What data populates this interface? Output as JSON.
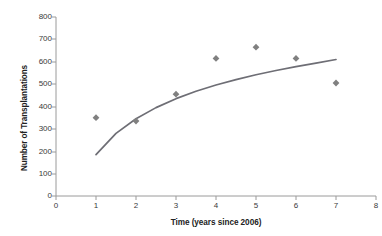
{
  "chart_data": {
    "type": "scatter",
    "title": "",
    "xlabel": "Time (years since 2006)",
    "ylabel": "Number of Transplantations",
    "xlim": [
      0,
      8
    ],
    "ylim": [
      0,
      800
    ],
    "x_ticks": [
      "0",
      "1",
      "2",
      "3",
      "4",
      "5",
      "6",
      "7",
      "8"
    ],
    "y_ticks": [
      "0",
      "100",
      "200",
      "300",
      "400",
      "500",
      "600",
      "700",
      "800"
    ],
    "grid": false,
    "legend": "none",
    "marker_color": "#808080",
    "marker_shape": "diamond",
    "line_color": "#6e6e75",
    "x": [
      1,
      2,
      3,
      4,
      5,
      6,
      7
    ],
    "values": [
      350,
      335,
      455,
      615,
      665,
      615,
      505
    ],
    "series": [
      {
        "name": "Number of Transplantations",
        "type": "scatter",
        "x": [
          1,
          2,
          3,
          4,
          5,
          6,
          7
        ],
        "values": [
          350,
          335,
          455,
          615,
          665,
          615,
          505
        ]
      },
      {
        "name": "Logarithmic trendline",
        "type": "line",
        "x": [
          1,
          1.5,
          2,
          2.5,
          3,
          3.5,
          4,
          4.5,
          5,
          5.5,
          6,
          6.5,
          7
        ],
        "values": [
          185,
          280,
          345,
          395,
          435,
          468,
          496,
          520,
          542,
          561,
          578,
          594,
          610
        ]
      }
    ]
  }
}
